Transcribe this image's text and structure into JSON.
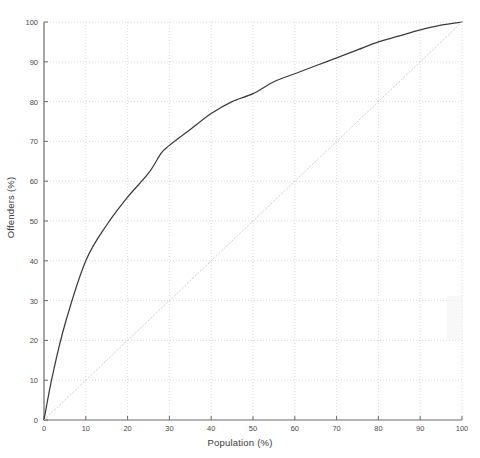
{
  "chart_data": {
    "type": "line",
    "title": "",
    "xlabel": "Population (%)",
    "ylabel": "Offenders (%)",
    "xlim": [
      0,
      100
    ],
    "ylim": [
      0,
      100
    ],
    "xticks": [
      0,
      10,
      20,
      30,
      40,
      50,
      60,
      70,
      80,
      90,
      100
    ],
    "yticks": [
      0,
      10,
      20,
      30,
      40,
      50,
      60,
      70,
      80,
      90,
      100
    ],
    "grid": true,
    "legend": "none",
    "series": [
      {
        "name": "Lorenz curve",
        "style": "solid",
        "color": "#3c3c3c",
        "x": [
          0,
          2,
          5,
          10,
          15,
          20,
          25,
          28,
          30,
          35,
          40,
          45,
          50,
          55,
          60,
          65,
          70,
          75,
          80,
          85,
          90,
          95,
          100
        ],
        "y": [
          0,
          11,
          24,
          40,
          49,
          56,
          62,
          67,
          69,
          73,
          77,
          80,
          82,
          85,
          87,
          89,
          91,
          93,
          95,
          96.5,
          98,
          99.2,
          100
        ]
      },
      {
        "name": "Line of equality",
        "style": "dotted",
        "color": "#c9c9c9",
        "x": [
          0,
          100
        ],
        "y": [
          0,
          100
        ]
      }
    ]
  },
  "axis": {
    "x_tick_labels": [
      "0",
      "10",
      "20",
      "30",
      "40",
      "50",
      "60",
      "70",
      "80",
      "90",
      "100"
    ],
    "y_tick_labels": [
      "0",
      "10",
      "20",
      "30",
      "40",
      "50",
      "60",
      "70",
      "80",
      "90",
      "100"
    ]
  }
}
